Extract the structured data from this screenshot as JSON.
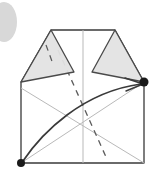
{
  "figure": {
    "title": "Origami fold step diagram",
    "type": "origami-diagram",
    "width": 160,
    "height": 181,
    "background_color": "#ffffff"
  },
  "colors": {
    "outline": "#3a3a3a",
    "flap_fill": "#e3e3e3",
    "flap_stroke": "#4a4a4a",
    "crease_light": "#b9b9b9",
    "crease_dashed": "#5a5a5a",
    "arrow": "#3a3a3a",
    "vertex_dot": "#1a1a1a",
    "corner_blob": "#d8d8d8"
  },
  "shapes": {
    "corner_blob": {
      "name": "page-corner-smudge",
      "cx": 4,
      "cy": 22,
      "rx": 13,
      "ry": 20,
      "fill": "#d8d8d8"
    },
    "body": {
      "name": "folded-paper-body",
      "points": "51,30 115,30 144,82 144,163 21,163 21,82",
      "fill": "#ffffff",
      "stroke": "#3a3a3a"
    },
    "left_flap": {
      "name": "left-triangular-flap",
      "points": "51,30 74,72 21,82",
      "fill": "#e3e3e3",
      "stroke": "#4a4a4a"
    },
    "right_flap": {
      "name": "right-triangular-flap",
      "points": "115,30 144,82 92,72",
      "fill": "#e3e3e3",
      "stroke": "#4a4a4a"
    },
    "creases_light": [
      {
        "name": "crease-diagonal-up-right",
        "x1": 21,
        "y1": 163,
        "x2": 144,
        "y2": 82
      },
      {
        "name": "crease-diagonal-down-right",
        "x1": 21,
        "y1": 88,
        "x2": 144,
        "y2": 163
      },
      {
        "name": "crease-vertical-center",
        "x1": 83,
        "y1": 30,
        "x2": 83,
        "y2": 163
      }
    ],
    "creases_dashed": [
      {
        "name": "fold-line-main-dashed",
        "x1": 58,
        "y1": 50,
        "x2": 106,
        "y2": 157
      },
      {
        "name": "fold-line-left-flap-dashed",
        "x1": 46,
        "y1": 46,
        "x2": 52,
        "y2": 62
      }
    ],
    "arrow": {
      "name": "fold-motion-arrow",
      "path": "M 23,161 C 40,132 80,92 140,84",
      "head": "M 127,79 L 142,84 L 127,90",
      "stroke": "#3a3a3a"
    },
    "vertex_dots": [
      {
        "name": "vertex-dot-bottom-left",
        "cx": 21,
        "cy": 163,
        "r": 4
      },
      {
        "name": "vertex-dot-right",
        "cx": 144,
        "cy": 82,
        "r": 4.5
      }
    ]
  }
}
